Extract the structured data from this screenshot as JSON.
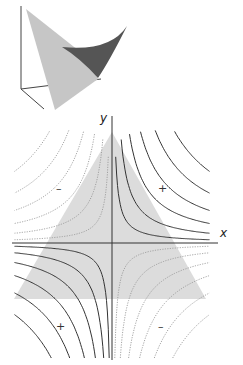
{
  "figure": {
    "inset": {
      "name": "3d-saddle-surface",
      "colors": {
        "light_face": "#c4c4c4",
        "dark_face": "#5a5a5a",
        "axes": "#333333"
      }
    },
    "contour_plot": {
      "axis_labels": {
        "x": "x",
        "y": "y"
      },
      "quadrant_signs": {
        "q1": "+",
        "q2": "–",
        "q3": "+",
        "q4": "–"
      },
      "shaded_region": {
        "shape": "triangle",
        "color": "#d9d9d9"
      },
      "contour_levels": [
        0.15,
        0.45,
        0.9,
        1.5,
        2.3,
        3.3
      ],
      "solid_color": "#333333",
      "dotted_color": "#9a9a9a"
    }
  }
}
